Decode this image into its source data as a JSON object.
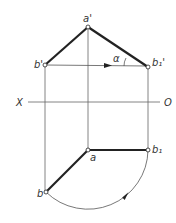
{
  "diagram": {
    "labels": {
      "a_prime": "a'",
      "b_prime": "b'",
      "b1_prime": "b₁'",
      "alpha": "α",
      "x_axis": "X",
      "o_axis": "O",
      "a": "a",
      "b": "b",
      "b1": "b₁"
    },
    "colors": {
      "thick": "#222222",
      "thin": "#555555"
    }
  }
}
